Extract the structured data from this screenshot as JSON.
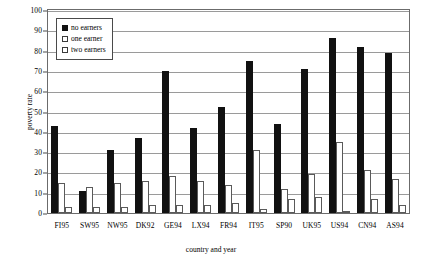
{
  "chart_data": {
    "type": "bar",
    "title": "",
    "xlabel": "country and year",
    "ylabel": "poverty rate",
    "ylim": [
      0,
      100
    ],
    "ytick_step": 10,
    "yticks": [
      100,
      90,
      80,
      70,
      60,
      50,
      40,
      30,
      20,
      10,
      0
    ],
    "grid": true,
    "legend_position": "upper left",
    "categories": [
      "FI95",
      "SW95",
      "NW95",
      "DK92",
      "GE94",
      "LX94",
      "FR94",
      "IT95",
      "SP90",
      "UK95",
      "US94",
      "CN94",
      "AS94"
    ],
    "series": [
      {
        "name": "no earners",
        "color": "#111111",
        "values": [
          43,
          11,
          31,
          37,
          70,
          42,
          52,
          75,
          44,
          71,
          86,
          82,
          79
        ]
      },
      {
        "name": "one earner",
        "color": "#ffffff",
        "values": [
          15,
          13,
          15,
          16,
          18,
          16,
          14,
          31,
          12,
          19,
          35,
          21,
          17
        ]
      },
      {
        "name": "two earners",
        "color": "#ffffff",
        "values": [
          3,
          3,
          3,
          4,
          4,
          4,
          5,
          2,
          7,
          8,
          1,
          7,
          4
        ]
      }
    ]
  },
  "legend": {
    "items": [
      {
        "label": "no earners"
      },
      {
        "label": "one earner"
      },
      {
        "label": "two earners"
      }
    ]
  }
}
